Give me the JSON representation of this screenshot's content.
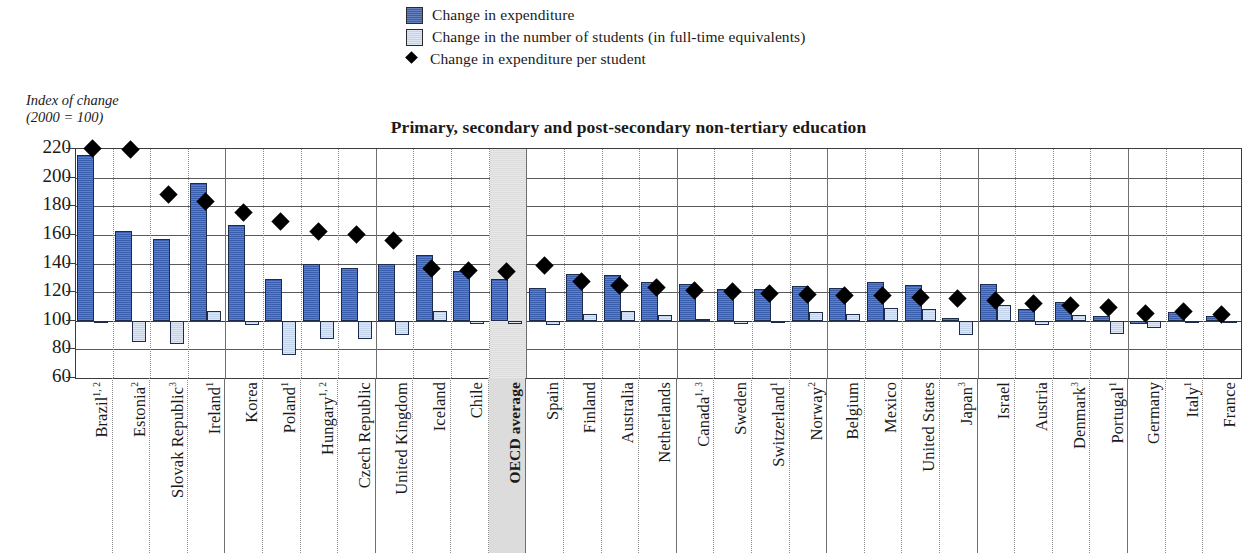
{
  "legend": {
    "items": [
      {
        "marker": "square-dark-blue-icon",
        "label": "Change in expenditure"
      },
      {
        "marker": "square-light-blue-icon",
        "label": "Change in the number of students (in full-time equivalents)"
      },
      {
        "marker": "diamond-black-icon",
        "label": "Change in expenditure per student"
      }
    ]
  },
  "axis_caption": {
    "line1": "Index of change",
    "line2": "(2000 = 100)"
  },
  "chart_data": {
    "type": "bar",
    "title": "Primary, secondary and post-secondary non-tertiary education",
    "xlabel": "",
    "ylabel": "Index of change (2000 = 100)",
    "ylim": [
      60,
      220
    ],
    "yticks": [
      220,
      200,
      180,
      160,
      140,
      120,
      100,
      80,
      60
    ],
    "baseline": 100,
    "grid": true,
    "legend_position": "top",
    "highlight_category": "OECD average",
    "categories": [
      "Brazil",
      "Estonia",
      "Slovak Republic",
      "Ireland",
      "Korea",
      "Poland",
      "Hungary",
      "Czech Republic",
      "United Kingdom",
      "Iceland",
      "Chile",
      "OECD average",
      "Spain",
      "Finland",
      "Australia",
      "Netherlands",
      "Canada",
      "Sweden",
      "Switzerland",
      "Norway",
      "Belgium",
      "Mexico",
      "United States",
      "Japan",
      "Israel",
      "Austria",
      "Denmark",
      "Portugal",
      "Germany",
      "Italy",
      "France"
    ],
    "category_notes": [
      "1, 2",
      "2",
      "3",
      "1",
      "",
      "1",
      "1, 2",
      "",
      "",
      "",
      "",
      "",
      "",
      "",
      "",
      "",
      "1, 3",
      "",
      "1",
      "2",
      "",
      "",
      "",
      "3",
      "",
      "",
      "3",
      "1",
      "",
      "1",
      ""
    ],
    "series": [
      {
        "name": "Change in expenditure",
        "values": [
          216,
          163,
          157,
          196,
          167,
          129,
          140,
          137,
          140,
          146,
          135,
          129,
          123,
          133,
          132,
          127,
          126,
          122,
          122,
          124,
          123,
          127,
          125,
          102,
          126,
          108,
          113,
          103,
          98,
          106,
          103
        ]
      },
      {
        "name": "Change in the number of students (in full-time equivalents)",
        "values": [
          99,
          85,
          84,
          107,
          97,
          76,
          87,
          87,
          90,
          107,
          98,
          98,
          97,
          105,
          107,
          104,
          101,
          98,
          100,
          106,
          105,
          109,
          108,
          90,
          111,
          97,
          104,
          91,
          95,
          100,
          100
        ]
      }
    ],
    "markers": {
      "name": "Change in expenditure per student",
      "values": [
        220,
        219,
        188,
        183,
        175,
        169,
        162,
        160,
        156,
        136,
        135,
        134,
        138,
        127,
        124,
        123,
        121,
        120,
        119,
        118,
        117,
        117,
        116,
        115,
        114,
        112,
        110,
        109,
        105,
        106,
        104
      ]
    }
  },
  "colors": {
    "expenditure": "#3a5fae",
    "students": "#c3d3ea",
    "per_student": "#000000",
    "highlight_band": "#dcdcdc"
  }
}
